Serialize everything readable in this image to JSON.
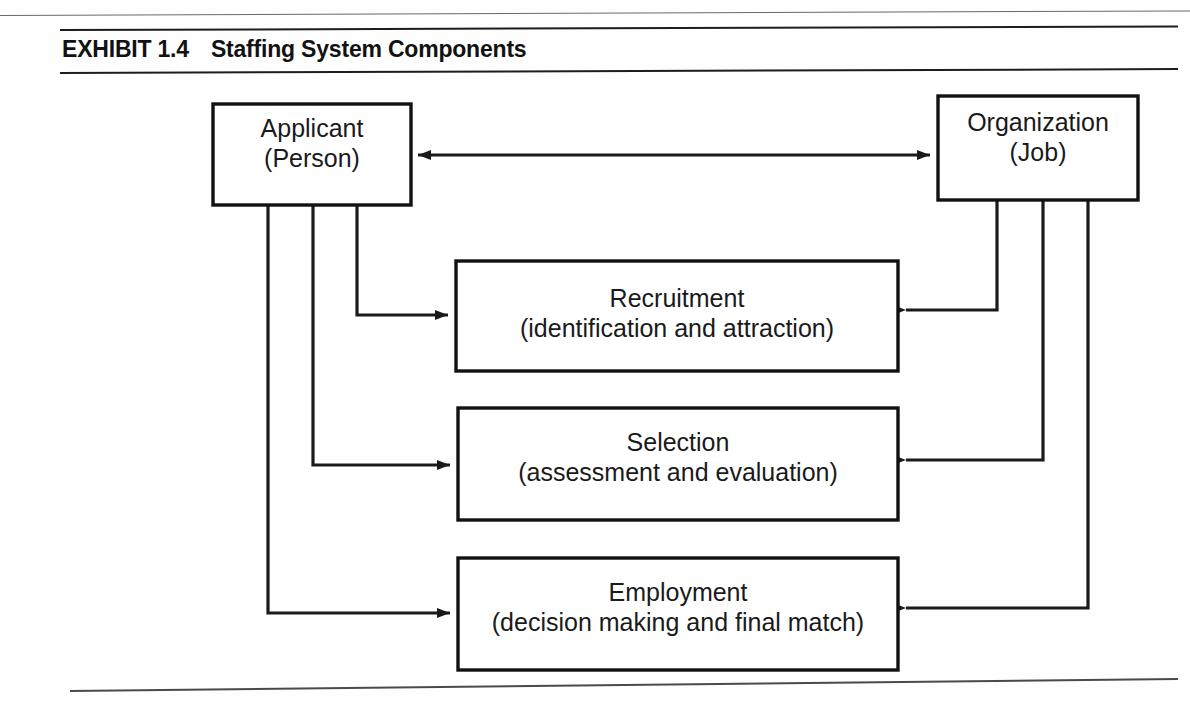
{
  "exhibit": {
    "label": "EXHIBIT 1.4",
    "caption": "Staffing System Components"
  },
  "diagram": {
    "type": "flow-diagram",
    "nodes": [
      {
        "id": "applicant",
        "line1": "Applicant",
        "line2": "(Person)",
        "x": 213,
        "y": 104,
        "w": 198,
        "h": 101
      },
      {
        "id": "organization",
        "line1": "Organization",
        "line2": "(Job)",
        "x": 938,
        "y": 96,
        "w": 200,
        "h": 104
      },
      {
        "id": "recruitment",
        "line1": "Recruitment",
        "line2": "(identification and attraction)",
        "x": 456,
        "y": 261,
        "w": 442,
        "h": 110
      },
      {
        "id": "selection",
        "line1": "Selection",
        "line2": "(assessment and evaluation)",
        "x": 458,
        "y": 408,
        "w": 440,
        "h": 112
      },
      {
        "id": "employment",
        "line1": "Employment",
        "line2": "(decision making and final match)",
        "x": 458,
        "y": 558,
        "w": 440,
        "h": 112
      }
    ],
    "edges": [
      {
        "id": "applicant-organization",
        "from": "applicant",
        "to": "organization",
        "arrow": "both"
      },
      {
        "id": "applicant-recruitment",
        "from": "applicant",
        "to": "recruitment",
        "arrow": "to"
      },
      {
        "id": "applicant-selection",
        "from": "applicant",
        "to": "selection",
        "arrow": "to"
      },
      {
        "id": "applicant-employment",
        "from": "applicant",
        "to": "employment",
        "arrow": "to"
      },
      {
        "id": "organization-recruitment",
        "from": "organization",
        "to": "recruitment",
        "arrow": "to"
      },
      {
        "id": "organization-selection",
        "from": "organization",
        "to": "selection",
        "arrow": "to"
      },
      {
        "id": "organization-employment",
        "from": "organization",
        "to": "employment",
        "arrow": "to"
      }
    ],
    "colors": {
      "stroke": "#1a1a1a",
      "fill": "#ffffff",
      "page": "#fefefe"
    }
  }
}
